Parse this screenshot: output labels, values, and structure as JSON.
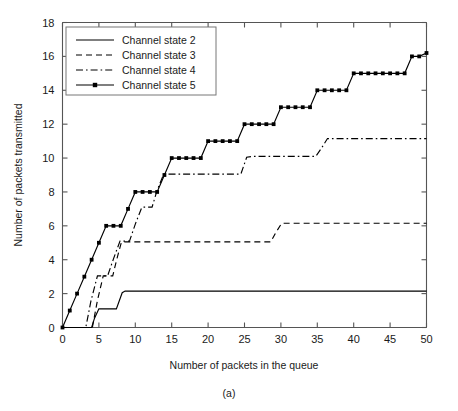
{
  "figure": {
    "caption": "(a)",
    "background": "#ffffff"
  },
  "chart_data": {
    "type": "line",
    "title": "",
    "subtitle": "",
    "xlabel": "Number of packets in the queue",
    "ylabel": "Number of packets transmitted",
    "xlim": [
      0,
      50
    ],
    "ylim": [
      0,
      18
    ],
    "xticks": [
      0,
      5,
      10,
      15,
      20,
      25,
      30,
      35,
      40,
      45,
      50
    ],
    "yticks": [
      0,
      2,
      4,
      6,
      8,
      10,
      12,
      14,
      16,
      18
    ],
    "grid": false,
    "legend_position": "top-left",
    "line_color": "#000000",
    "axis_color": "#555555",
    "series": [
      {
        "name": "Channel state 2",
        "style": "solid",
        "markers": false,
        "x": [
          0,
          4,
          4.4,
          5.0,
          7.4,
          8.2,
          8.6,
          50
        ],
        "y": [
          0,
          0,
          0.55,
          1.1,
          1.1,
          2.05,
          2.15,
          2.15
        ]
      },
      {
        "name": "Channel state 3",
        "style": "dashed",
        "markers": false,
        "x": [
          0,
          4.1,
          4.8,
          5.6,
          6.9,
          7.5,
          8.1,
          28.6,
          29.3,
          30.1,
          50
        ],
        "y": [
          0,
          0,
          1.6,
          3.05,
          3.05,
          4.1,
          5.05,
          5.05,
          5.6,
          6.15,
          6.15
        ]
      },
      {
        "name": "Channel state 4",
        "style": "dashdot",
        "markers": false,
        "x": [
          0,
          3.2,
          3.9,
          4.8,
          6.2,
          7.0,
          7.9,
          9.2,
          10.0,
          10.9,
          12.3,
          13.0,
          13.9,
          24.5,
          25.3,
          26.2,
          34.8,
          35.6,
          36.4,
          50
        ],
        "y": [
          0,
          0,
          1.55,
          3.05,
          3.05,
          4.05,
          5.1,
          5.1,
          6.1,
          7.1,
          7.1,
          8.1,
          9.05,
          9.05,
          10.05,
          10.1,
          10.1,
          10.6,
          11.15,
          11.15
        ]
      },
      {
        "name": "Channel state 5",
        "style": "solid-markers",
        "markers": true,
        "x": [
          0,
          1,
          2,
          3,
          4,
          5,
          6,
          7,
          8,
          9,
          10,
          11,
          12,
          13,
          14,
          15,
          16,
          17,
          18,
          19,
          20,
          21,
          22,
          23,
          24,
          25,
          26,
          27,
          28,
          29,
          30,
          31,
          32,
          33,
          34,
          35,
          36,
          37,
          38,
          39,
          40,
          41,
          42,
          43,
          44,
          45,
          46,
          47,
          48,
          49,
          50
        ],
        "y": [
          0,
          1,
          2,
          3,
          4,
          5,
          6,
          6,
          6,
          7,
          8,
          8,
          8,
          8,
          9,
          10,
          10,
          10,
          10,
          10,
          11,
          11,
          11,
          11,
          11,
          12,
          12,
          12,
          12,
          12,
          13,
          13,
          13,
          13,
          13,
          14,
          14,
          14,
          14,
          14,
          15,
          15,
          15,
          15,
          15,
          15,
          15,
          15,
          16,
          16,
          16.2
        ]
      }
    ]
  }
}
